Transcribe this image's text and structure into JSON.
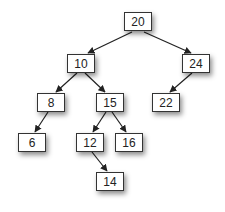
{
  "diagram": {
    "type": "binary-search-tree",
    "nodes": [
      {
        "id": "n20",
        "label": "20",
        "x": 124,
        "y": 12
      },
      {
        "id": "n10",
        "label": "10",
        "x": 67,
        "y": 54
      },
      {
        "id": "n24",
        "label": "24",
        "x": 182,
        "y": 54
      },
      {
        "id": "n8",
        "label": "8",
        "x": 37,
        "y": 93
      },
      {
        "id": "n15",
        "label": "15",
        "x": 96,
        "y": 93
      },
      {
        "id": "n22",
        "label": "22",
        "x": 152,
        "y": 93
      },
      {
        "id": "n6",
        "label": "6",
        "x": 18,
        "y": 133
      },
      {
        "id": "n12",
        "label": "12",
        "x": 76,
        "y": 133
      },
      {
        "id": "n16",
        "label": "16",
        "x": 115,
        "y": 133
      },
      {
        "id": "n14",
        "label": "14",
        "x": 96,
        "y": 172
      }
    ],
    "edges": [
      {
        "from": "20",
        "to": "10"
      },
      {
        "from": "20",
        "to": "24"
      },
      {
        "from": "10",
        "to": "8"
      },
      {
        "from": "10",
        "to": "15"
      },
      {
        "from": "24",
        "to": "22"
      },
      {
        "from": "8",
        "to": "6"
      },
      {
        "from": "15",
        "to": "12"
      },
      {
        "from": "15",
        "to": "16"
      },
      {
        "from": "12",
        "to": "14"
      }
    ],
    "colors": {
      "border": "#333333",
      "edge": "#222222",
      "text": "#222222"
    }
  }
}
